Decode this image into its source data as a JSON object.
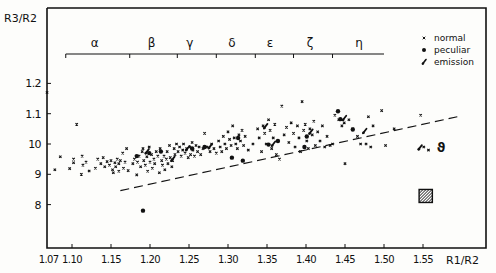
{
  "chart_data": {
    "type": "scatter",
    "title": "",
    "xlabel": "R1/R2",
    "ylabel": "R3/R2",
    "xlim": [
      1.07,
      1.59
    ],
    "ylim": [
      0.66,
      1.45
    ],
    "x_ticks": [
      {
        "value": 1.07,
        "label": "1.07"
      },
      {
        "value": 1.1,
        "label": "1.10"
      },
      {
        "value": 1.15,
        "label": "1.15"
      },
      {
        "value": 1.2,
        "label": "1.20"
      },
      {
        "value": 1.25,
        "label": "1.25"
      },
      {
        "value": 1.3,
        "label": "1.30"
      },
      {
        "value": 1.35,
        "label": "1.35"
      },
      {
        "value": 1.4,
        "label": "1.40"
      },
      {
        "value": 1.45,
        "label": "1.45"
      },
      {
        "value": 1.5,
        "label": "1.50"
      },
      {
        "value": 1.55,
        "label": "1.55"
      }
    ],
    "y_ticks": [
      {
        "value": 1.2,
        "label": "1.2"
      },
      {
        "value": 1.1,
        "label": "1.1"
      },
      {
        "value": 1.0,
        "label": "10"
      },
      {
        "value": 0.9,
        "label": "9"
      },
      {
        "value": 0.8,
        "label": "8"
      }
    ],
    "grid": false,
    "legend": {
      "position": "top-right",
      "entries": [
        {
          "marker": "x",
          "label": "normal"
        },
        {
          "marker": "dot",
          "label": "peculiar"
        },
        {
          "marker": "tick",
          "label": "emission"
        }
      ]
    },
    "groups": {
      "bar_y": 1.53,
      "ticks": [
        1.092,
        1.174,
        1.235,
        1.285,
        1.335,
        1.384,
        1.434
      ],
      "bar_end": 1.5,
      "labels": [
        {
          "symbol": "α",
          "x": 1.129
        },
        {
          "symbol": "β",
          "x": 1.202
        },
        {
          "symbol": "γ",
          "x": 1.251
        },
        {
          "symbol": "δ",
          "x": 1.305
        },
        {
          "symbol": "ε",
          "x": 1.354
        },
        {
          "symbol": "ζ",
          "x": 1.405
        },
        {
          "symbol": "η",
          "x": 1.468
        }
      ]
    },
    "annotations": [
      {
        "type": "dashed_line",
        "from": [
          1.162,
          0.846
        ],
        "to": [
          1.594,
          1.09
        ],
        "label": "lower envelope"
      },
      {
        "type": "text",
        "text": "ϑ",
        "x": 1.573,
        "y": 0.99
      },
      {
        "type": "hatched_box",
        "x": [
          1.545,
          1.562
        ],
        "y": [
          0.807,
          0.85
        ]
      }
    ],
    "series": [
      {
        "name": "normal",
        "marker": "x",
        "points": [
          [
            1.068,
            1.17
          ],
          [
            1.078,
            0.915
          ],
          [
            1.085,
            0.958
          ],
          [
            1.097,
            0.919
          ],
          [
            1.102,
            0.95
          ],
          [
            1.102,
            0.938
          ],
          [
            1.112,
            0.9
          ],
          [
            1.113,
            0.96
          ],
          [
            1.118,
            0.94
          ],
          [
            1.114,
            0.93
          ],
          [
            1.106,
            1.065
          ],
          [
            1.122,
            0.911
          ],
          [
            1.13,
            0.92
          ],
          [
            1.133,
            0.95
          ],
          [
            1.137,
            0.935
          ],
          [
            1.14,
            0.955
          ],
          [
            1.142,
            0.925
          ],
          [
            1.145,
            0.942
          ],
          [
            1.148,
            0.93
          ],
          [
            1.15,
            0.945
          ],
          [
            1.152,
            0.915
          ],
          [
            1.155,
            0.938
          ],
          [
            1.153,
            0.905
          ],
          [
            1.156,
            0.925
          ],
          [
            1.158,
            0.95
          ],
          [
            1.16,
            0.935
          ],
          [
            1.16,
            0.91
          ],
          [
            1.162,
            0.945
          ],
          [
            1.165,
            0.97
          ],
          [
            1.166,
            0.92
          ],
          [
            1.168,
            0.94
          ],
          [
            1.17,
            0.985
          ],
          [
            1.172,
            0.912
          ],
          [
            1.178,
            0.935
          ],
          [
            1.18,
            0.95
          ],
          [
            1.183,
            0.898
          ],
          [
            1.184,
            0.94
          ],
          [
            1.186,
            0.96
          ],
          [
            1.188,
            0.925
          ],
          [
            1.19,
            0.975
          ],
          [
            1.191,
            0.985
          ],
          [
            1.192,
            0.945
          ],
          [
            1.194,
            0.93
          ],
          [
            1.196,
            0.958
          ],
          [
            1.197,
            0.91
          ],
          [
            1.199,
            0.99
          ],
          [
            1.2,
            0.94
          ],
          [
            1.202,
            0.965
          ],
          [
            1.203,
            0.92
          ],
          [
            1.205,
            0.95
          ],
          [
            1.206,
            0.935
          ],
          [
            1.208,
            0.975
          ],
          [
            1.21,
            0.96
          ],
          [
            1.212,
            0.905
          ],
          [
            1.213,
            0.985
          ],
          [
            1.215,
            0.945
          ],
          [
            1.216,
            0.93
          ],
          [
            1.218,
            0.96
          ],
          [
            1.219,
            0.915
          ],
          [
            1.221,
            0.95
          ],
          [
            1.222,
            0.975
          ],
          [
            1.223,
            0.935
          ],
          [
            1.225,
            0.995
          ],
          [
            1.226,
            0.955
          ],
          [
            1.228,
            0.925
          ],
          [
            1.229,
            0.945
          ],
          [
            1.231,
            0.985
          ],
          [
            1.232,
            0.965
          ],
          [
            1.234,
            1.0
          ],
          [
            1.236,
            0.975
          ],
          [
            1.238,
            0.99
          ],
          [
            1.24,
            0.96
          ],
          [
            1.242,
            0.98
          ],
          [
            1.243,
            1.0
          ],
          [
            1.245,
            0.97
          ],
          [
            1.247,
            0.985
          ],
          [
            1.249,
            0.955
          ],
          [
            1.251,
            0.99
          ],
          [
            1.252,
            0.965
          ],
          [
            1.254,
            1.005
          ],
          [
            1.255,
            0.98
          ],
          [
            1.257,
            0.96
          ],
          [
            1.259,
            0.995
          ],
          [
            1.261,
            0.975
          ],
          [
            1.263,
            0.99
          ],
          [
            1.265,
            0.965
          ],
          [
            1.268,
            0.985
          ],
          [
            1.27,
            1.035
          ],
          [
            1.273,
            0.99
          ],
          [
            1.277,
            0.975
          ],
          [
            1.279,
            1.0
          ],
          [
            1.282,
            0.985
          ],
          [
            1.285,
            0.97
          ],
          [
            1.288,
            1.01
          ],
          [
            1.29,
            0.99
          ],
          [
            1.292,
            0.975
          ],
          [
            1.294,
            1.025
          ],
          [
            1.296,
            1.0
          ],
          [
            1.298,
            0.985
          ],
          [
            1.3,
            1.04
          ],
          [
            1.302,
            1.015
          ],
          [
            1.304,
            0.995
          ],
          [
            1.306,
            1.06
          ],
          [
            1.308,
            1.02
          ],
          [
            1.31,
            1.0
          ],
          [
            1.312,
            0.985
          ],
          [
            1.314,
            1.03
          ],
          [
            1.316,
            1.01
          ],
          [
            1.318,
            1.045
          ],
          [
            1.32,
            0.995
          ],
          [
            1.322,
            1.025
          ],
          [
            1.326,
            0.98
          ],
          [
            1.332,
            1.0
          ],
          [
            1.338,
            1.05
          ],
          [
            1.34,
            1.02
          ],
          [
            1.343,
            0.975
          ],
          [
            1.345,
            1.06
          ],
          [
            1.347,
            1.035
          ],
          [
            1.349,
            1.0
          ],
          [
            1.352,
            1.08
          ],
          [
            1.354,
            1.045
          ],
          [
            1.356,
            0.985
          ],
          [
            1.358,
            1.02
          ],
          [
            1.36,
            1.065
          ],
          [
            1.362,
            0.965
          ],
          [
            1.366,
            0.95
          ],
          [
            1.369,
            1.125
          ],
          [
            1.372,
            1.03
          ],
          [
            1.375,
            1.055
          ],
          [
            1.378,
            1.005
          ],
          [
            1.381,
            1.07
          ],
          [
            1.384,
            1.035
          ],
          [
            1.386,
            0.99
          ],
          [
            1.389,
            1.06
          ],
          [
            1.391,
            1.02
          ],
          [
            1.393,
            0.975
          ],
          [
            1.395,
            1.14
          ],
          [
            1.397,
            1.045
          ],
          [
            1.399,
            1.065
          ],
          [
            1.401,
            1.01
          ],
          [
            1.403,
            0.985
          ],
          [
            1.405,
            1.05
          ],
          [
            1.408,
            1.03
          ],
          [
            1.41,
            1.075
          ],
          [
            1.412,
            0.995
          ],
          [
            1.415,
            1.04
          ],
          [
            1.418,
            1.01
          ],
          [
            1.421,
            1.06
          ],
          [
            1.424,
            0.99
          ],
          [
            1.427,
            1.025
          ],
          [
            1.431,
            0.995
          ],
          [
            1.434,
            1.0
          ],
          [
            1.437,
            1.095
          ],
          [
            1.442,
            1.08
          ],
          [
            1.446,
            1.06
          ],
          [
            1.449,
            1.07
          ],
          [
            1.45,
            0.935
          ],
          [
            1.455,
            1.08
          ],
          [
            1.46,
            1.05
          ],
          [
            1.466,
            1.025
          ],
          [
            1.47,
            1.0
          ],
          [
            1.477,
            1.0
          ],
          [
            1.48,
            1.09
          ],
          [
            1.483,
            0.99
          ],
          [
            1.486,
            1.06
          ],
          [
            1.497,
            1.11
          ],
          [
            1.502,
            0.995
          ],
          [
            1.513,
            1.05
          ],
          [
            1.547,
            1.095
          ],
          [
            1.551,
            0.99
          ],
          [
            1.557,
            0.98
          ]
        ]
      },
      {
        "name": "peculiar",
        "marker": "dot",
        "points": [
          [
            1.191,
            0.78
          ],
          [
            1.183,
            0.96
          ],
          [
            1.199,
            0.97
          ],
          [
            1.214,
            0.975
          ],
          [
            1.254,
            0.985
          ],
          [
            1.27,
            0.99
          ],
          [
            1.305,
            0.955
          ],
          [
            1.313,
            1.02
          ],
          [
            1.319,
            0.945
          ],
          [
            1.352,
            0.998
          ],
          [
            1.364,
            1.01
          ],
          [
            1.401,
            1.025
          ],
          [
            1.398,
            0.99
          ],
          [
            1.441,
            1.108
          ],
          [
            1.444,
            1.082
          ],
          [
            1.46,
            1.048
          ]
        ]
      },
      {
        "name": "emission",
        "marker": "tick",
        "points": [
          [
            1.196,
            0.975
          ],
          [
            1.229,
            0.95
          ],
          [
            1.248,
            0.985
          ],
          [
            1.277,
            0.992
          ],
          [
            1.348,
            1.058
          ],
          [
            1.358,
            1.0
          ],
          [
            1.406,
            1.04
          ],
          [
            1.449,
            1.085
          ],
          [
            1.475,
            1.042
          ],
          [
            1.546,
            0.988
          ]
        ]
      }
    ]
  }
}
